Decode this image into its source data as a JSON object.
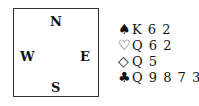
{
  "compass": {
    "north": "N",
    "south": "S",
    "west": "W",
    "east": "E"
  },
  "hand": {
    "suits": [
      {
        "name": "spades",
        "symbol": "♠",
        "cards": "K 6 2"
      },
      {
        "name": "hearts",
        "symbol": "♡",
        "cards": "Q 6 2"
      },
      {
        "name": "diamonds",
        "symbol": "◇",
        "cards": "Q 5"
      },
      {
        "name": "clubs",
        "symbol": "♣",
        "cards": "Q 9 8 7 3"
      }
    ]
  }
}
